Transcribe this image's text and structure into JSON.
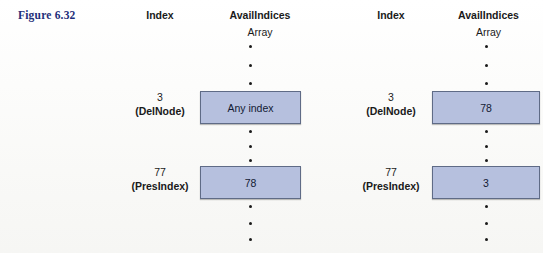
{
  "figure": {
    "label": "Figure 6.32",
    "label_color": "#1f2f7a"
  },
  "colors": {
    "cell_fill": "#b6c0de",
    "cell_border": "#5f6b86",
    "text": "#1a1a1a"
  },
  "panels": [
    {
      "id": "before",
      "headers": {
        "index": "Index",
        "avail": "AvailIndices",
        "array": "Array"
      },
      "rows": [
        {
          "index_number": "3",
          "index_name": "(DelNode)",
          "cell_value": "Any index"
        },
        {
          "index_number": "77",
          "index_name": "(PresIndex)",
          "cell_value": "78"
        }
      ]
    },
    {
      "id": "after",
      "headers": {
        "index": "Index",
        "avail": "AvailIndices",
        "array": "Array"
      },
      "rows": [
        {
          "index_number": "3",
          "index_name": "(DelNode)",
          "cell_value": "78"
        },
        {
          "index_number": "77",
          "index_name": "(PresIndex)",
          "cell_value": "3"
        }
      ]
    }
  ]
}
